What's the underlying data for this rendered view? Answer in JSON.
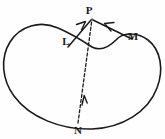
{
  "figure": {
    "type": "geometry-diagram",
    "background_color": "#fefefe",
    "stroke_color": "#1a1a1a"
  },
  "labels": {
    "p": "P",
    "l": "L",
    "m": "M",
    "n": "N"
  },
  "points": {
    "p": {
      "x": 92,
      "y": 16
    },
    "l": {
      "x": 72,
      "y": 44
    },
    "m": {
      "x": 128,
      "y": 38
    },
    "n": {
      "x": 78,
      "y": 126
    }
  },
  "shape": {
    "name": "closed-bean-curve",
    "path": "M 92 47 C 80 39 72 34 58 28 C 40 20 20 26 10 42 C 0 58 2 80 14 96 C 30 118 62 130 92 129 C 122 128 148 112 157 88 C 164 70 161 50 148 40 C 136 31 122 33 116 40 C 110 46 102 52 92 47 Z"
  },
  "segments": [
    {
      "name": "dashed-ray-n-to-p",
      "from": "n",
      "to": "p",
      "style": "dashed",
      "arrow": "midpoint-up"
    },
    {
      "name": "solid-ray-l-to-p",
      "from": "l",
      "to": "p",
      "style": "solid",
      "arrow": "toward-p"
    },
    {
      "name": "solid-ray-m-to-p",
      "from": "m",
      "to": "p",
      "style": "solid",
      "arrow": "toward-p"
    }
  ]
}
